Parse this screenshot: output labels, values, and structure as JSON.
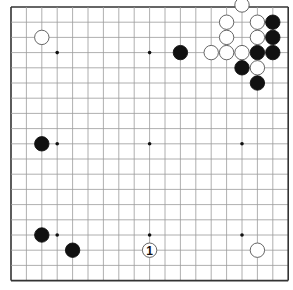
{
  "board": {
    "size": 19,
    "origin_x": 11,
    "origin_y": 7,
    "spacing_x": 15.4,
    "spacing_y": 15.2,
    "line_color": "#9a9a9a",
    "border_color": "#333333",
    "background": "#ffffff",
    "star_points": [
      [
        3,
        3
      ],
      [
        9,
        3
      ],
      [
        15,
        3
      ],
      [
        3,
        9
      ],
      [
        9,
        9
      ],
      [
        15,
        9
      ],
      [
        3,
        15
      ],
      [
        9,
        15
      ],
      [
        15,
        15
      ]
    ]
  },
  "stones": [
    {
      "color": "white",
      "col": 15,
      "row": 0
    },
    {
      "color": "white",
      "col": 14,
      "row": 1
    },
    {
      "color": "white",
      "col": 16,
      "row": 1
    },
    {
      "color": "black",
      "col": 17,
      "row": 1
    },
    {
      "color": "white",
      "col": 2,
      "row": 2
    },
    {
      "color": "white",
      "col": 14,
      "row": 2
    },
    {
      "color": "white",
      "col": 16,
      "row": 2
    },
    {
      "color": "black",
      "col": 17,
      "row": 2
    },
    {
      "color": "black",
      "col": 11,
      "row": 3
    },
    {
      "color": "white",
      "col": 13,
      "row": 3
    },
    {
      "color": "white",
      "col": 14,
      "row": 3
    },
    {
      "color": "white",
      "col": 15,
      "row": 3
    },
    {
      "color": "black",
      "col": 16,
      "row": 3
    },
    {
      "color": "black",
      "col": 17,
      "row": 3
    },
    {
      "color": "black",
      "col": 15,
      "row": 4
    },
    {
      "color": "white",
      "col": 16,
      "row": 4
    },
    {
      "color": "black",
      "col": 16,
      "row": 5
    },
    {
      "color": "black",
      "col": 2,
      "row": 9
    },
    {
      "color": "black",
      "col": 2,
      "row": 15
    },
    {
      "color": "black",
      "col": 4,
      "row": 16
    },
    {
      "color": "white",
      "col": 9,
      "row": 16,
      "label": "1"
    },
    {
      "color": "white",
      "col": 16,
      "row": 16
    }
  ]
}
